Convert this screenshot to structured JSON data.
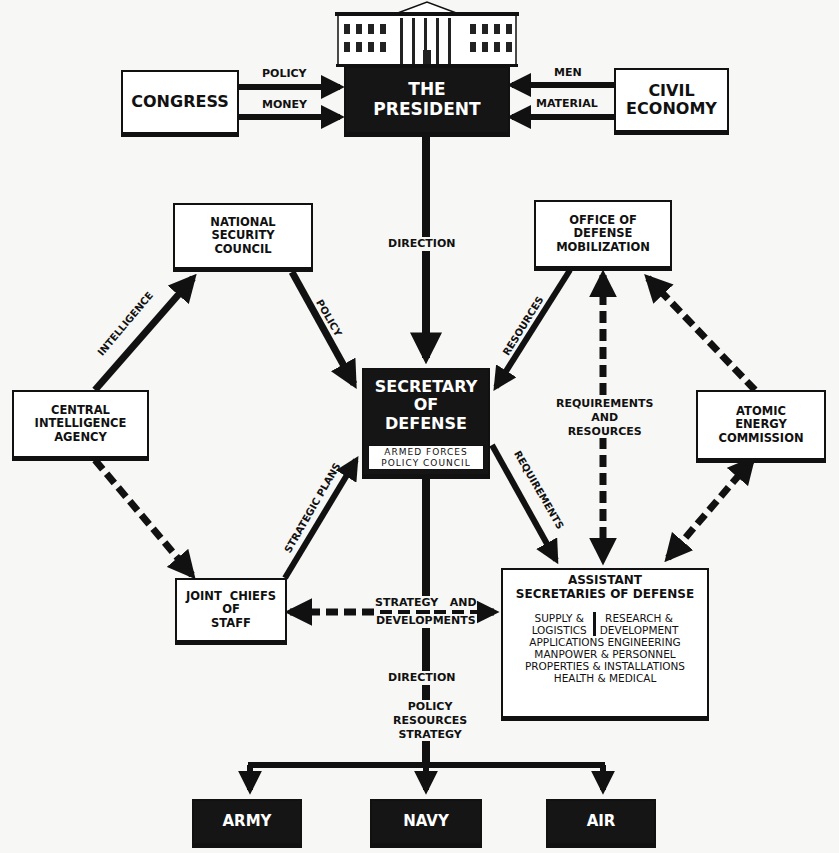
{
  "diagram": {
    "nodes": {
      "president": {
        "lines": [
          "THE",
          "PRESIDENT"
        ],
        "building_icon": "white-house-icon"
      },
      "congress": {
        "lines": [
          "CONGRESS"
        ]
      },
      "civil_economy": {
        "lines": [
          "CIVIL",
          "ECONOMY"
        ]
      },
      "nsc": {
        "lines": [
          "NATIONAL",
          "SECURITY",
          "COUNCIL"
        ]
      },
      "odm": {
        "lines": [
          "OFFICE OF",
          "DEFENSE",
          "MOBILIZATION"
        ]
      },
      "cia": {
        "lines": [
          "CENTRAL",
          "INTELLIGENCE",
          "AGENCY"
        ]
      },
      "secdef": {
        "lines": [
          "SECRETARY",
          "OF",
          "DEFENSE"
        ],
        "sub_lines": [
          "ARMED FORCES",
          "POLICY COUNCIL"
        ]
      },
      "aec": {
        "lines": [
          "ATOMIC",
          "ENERGY",
          "COMMISSION"
        ]
      },
      "jcs": {
        "lines": [
          "JOINT  CHIEFS",
          "OF",
          "STAFF"
        ]
      },
      "asd": {
        "title_lines": [
          "ASSISTANT",
          "SECRETARIES OF DEFENSE"
        ],
        "left_col": [
          "SUPPLY &",
          "LOGISTICS"
        ],
        "right_col": [
          "RESEARCH &",
          "DEVELOPMENT"
        ],
        "rows": [
          "APPLICATIONS ENGINEERING",
          "MANPOWER & PERSONNEL",
          "PROPERTIES & INSTALLATIONS",
          "HEALTH & MEDICAL"
        ]
      },
      "army": {
        "lines": [
          "ARMY"
        ]
      },
      "navy": {
        "lines": [
          "NAVY"
        ]
      },
      "air": {
        "lines": [
          "AIR"
        ]
      }
    },
    "edge_labels": {
      "policy_top": "POLICY",
      "money": "MONEY",
      "men": "MEN",
      "material": "MATERIAL",
      "direction_top": "DIRECTION",
      "intelligence": "INTELLIGENCE",
      "policy_nsc": "POLICY",
      "resources": "RESOURCES",
      "req_and_res": [
        "REQUIREMENTS",
        "AND",
        "RESOURCES"
      ],
      "strategic_plans": "STRATEGIC PLANS",
      "requirements": "REQUIREMENTS",
      "strategy_dev": [
        "STRATEGY   AND",
        "DEVELOPMENTS"
      ],
      "direction_bottom": "DIRECTION",
      "policy_res_strat": [
        "POLICY",
        "RESOURCES",
        "STRATEGY"
      ]
    },
    "colors": {
      "ink": "#111111",
      "paper": "#f7f7f5",
      "dark_box": "#151515",
      "box_fill": "#ffffff"
    }
  }
}
